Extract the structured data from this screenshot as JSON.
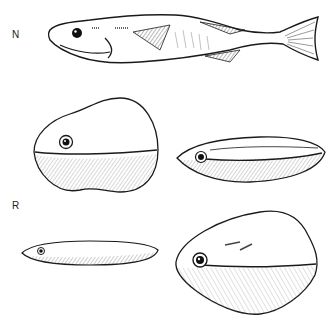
{
  "figure": {
    "panels": [
      {
        "label": "N",
        "description": "normal fish, lateral view"
      },
      {
        "label": "R",
        "description": "reduced / deformed fish body forms"
      }
    ],
    "specimens": [
      {
        "id": "normal-fish",
        "panel": "N",
        "shape": "fusiform fish with fins and forked tail"
      },
      {
        "id": "round-blob",
        "panel": "N-R",
        "shape": "rounded ovoid body with eye"
      },
      {
        "id": "elongated-blob",
        "panel": "N-R",
        "shape": "elongated spindle body with eye"
      },
      {
        "id": "thin-blob",
        "panel": "R",
        "shape": "thin flat elongated body with eye"
      },
      {
        "id": "diamond-blob",
        "panel": "R",
        "shape": "rhomboid body with eye and lateral line"
      }
    ],
    "colors": {
      "ink": "#1a1a1a",
      "paper": "#ffffff",
      "shade": "#555555"
    }
  }
}
